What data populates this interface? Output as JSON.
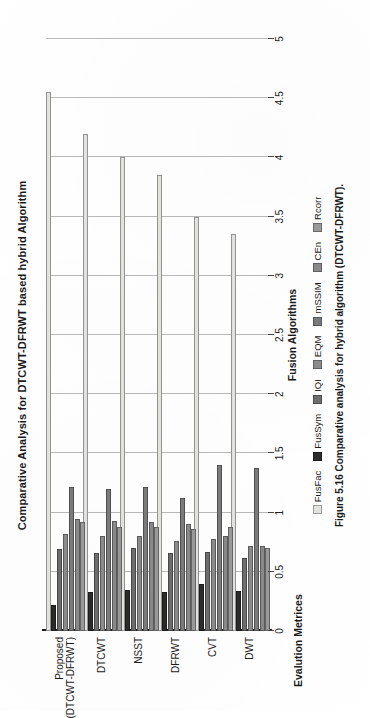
{
  "figure": {
    "caption": "Figure 5.16  Comparative analysis for hybrid algorithm (DTCWT-DFRWT).",
    "caption_number": "Figure 5.16"
  },
  "chart_data": {
    "type": "bar",
    "orientation": "vertical",
    "title": "Comparative Analysis for DTCWT-DFRWT based hybrid Algorithm",
    "xlabel": "Fusion Algorithms",
    "ylabel": "Evalution Metrices",
    "ylim": [
      0,
      5
    ],
    "yticks": [
      "0",
      "0.5",
      "1",
      "1.5",
      "2",
      "2.5",
      "3",
      "3.5",
      "4",
      "4.5",
      "5"
    ],
    "grid": true,
    "legend_position": "bottom",
    "categories": [
      "DWT",
      "CVT",
      "DFRWT",
      "NSST",
      "DTCWT",
      "Proposed (DTCWT-DFRWT)"
    ],
    "series": [
      {
        "name": "FusFac",
        "color": "#e3e3e0",
        "values": [
          3.35,
          3.5,
          3.85,
          4.0,
          4.2,
          4.55
        ]
      },
      {
        "name": "FusSym",
        "color": "#2b2b2b",
        "values": [
          0.34,
          0.4,
          0.33,
          0.35,
          0.33,
          0.22
        ]
      },
      {
        "name": "IQI",
        "color": "#6e6e6e",
        "values": [
          0.62,
          0.67,
          0.66,
          0.7,
          0.66,
          0.69
        ]
      },
      {
        "name": "EQM",
        "color": "#8c8c8c",
        "values": [
          0.72,
          0.78,
          0.76,
          0.8,
          0.8,
          0.82
        ]
      },
      {
        "name": "mSSIM",
        "color": "#7c7c7c",
        "values": [
          1.38,
          1.4,
          1.12,
          1.22,
          1.2,
          1.22
        ]
      },
      {
        "name": "CEn",
        "color": "#8a8a8a",
        "values": [
          0.72,
          0.8,
          0.9,
          0.92,
          0.93,
          0.95
        ]
      },
      {
        "name": "Rcorr",
        "color": "#9a9a9a",
        "values": [
          0.7,
          0.88,
          0.86,
          0.88,
          0.88,
          0.92
        ]
      }
    ],
    "legend": [
      {
        "label": "FusFac",
        "color": "#e3e3e0"
      },
      {
        "label": "FusSym",
        "color": "#2b2b2b"
      },
      {
        "label": "IQI",
        "color": "#6e6e6e"
      },
      {
        "label": "EQM",
        "color": "#8c8c8c"
      },
      {
        "label": "mSSIM",
        "color": "#7c7c7c"
      },
      {
        "label": "CEn",
        "color": "#8a8a8a"
      },
      {
        "label": "Rcorr",
        "color": "#9a9a9a"
      }
    ]
  }
}
